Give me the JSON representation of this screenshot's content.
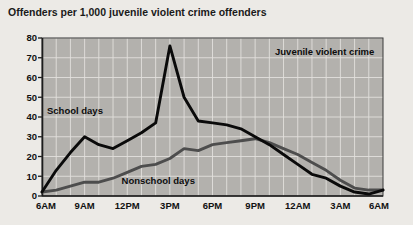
{
  "chart_data": {
    "type": "line",
    "title": "Offenders per 1,000 juvenile violent crime offenders",
    "xlabel": "",
    "ylabel": "",
    "ylim": [
      0,
      80
    ],
    "ytick_values": [
      0,
      10,
      20,
      30,
      40,
      50,
      60,
      70,
      80
    ],
    "ytick_labels": [
      "0",
      "10",
      "20",
      "30",
      "40",
      "50",
      "60",
      "70",
      "80"
    ],
    "xtick_labels": [
      "6AM",
      "9AM",
      "12PM",
      "3PM",
      "6PM",
      "9PM",
      "12AM",
      "3AM",
      "6AM"
    ],
    "xtick_positions": [
      0,
      3,
      6,
      9,
      12,
      15,
      18,
      21,
      24
    ],
    "x": [
      0,
      1,
      2,
      3,
      4,
      5,
      6,
      7,
      8,
      9,
      10,
      11,
      12,
      13,
      14,
      15,
      16,
      17,
      18,
      19,
      20,
      21,
      22,
      23,
      24
    ],
    "x_hour_labels": [
      "6AM",
      "7AM",
      "8AM",
      "9AM",
      "10AM",
      "11AM",
      "12PM",
      "1PM",
      "2PM",
      "3PM",
      "4PM",
      "5PM",
      "6PM",
      "7PM",
      "8PM",
      "9PM",
      "10PM",
      "11PM",
      "12AM",
      "1AM",
      "2AM",
      "3AM",
      "4AM",
      "5AM",
      "6AM"
    ],
    "grid": true,
    "legend_position": "inline-annotations",
    "annotations": [
      {
        "text": "Juvenile violent crime",
        "x_hour": 16.4,
        "y_value": 71.5
      },
      {
        "text": "School days",
        "x_hour": 0.35,
        "y_value": 41.5
      },
      {
        "text": "Nonschool days",
        "x_hour": 5.6,
        "y_value": 6.2
      }
    ],
    "series": [
      {
        "name": "School days",
        "color": "#0a0a0a",
        "values": [
          2,
          13,
          22,
          30,
          26,
          24,
          28,
          32,
          37,
          76,
          50,
          38,
          37,
          36,
          34,
          30,
          26,
          21,
          16,
          11,
          9,
          5,
          2,
          1,
          3
        ]
      },
      {
        "name": "Nonschool days",
        "color": "#4d4d4d",
        "values": [
          2,
          3,
          5,
          7,
          7,
          9,
          12,
          15,
          16,
          19,
          24,
          23,
          26,
          27,
          28,
          29,
          27,
          24,
          21,
          17,
          13,
          8,
          4,
          3,
          3
        ]
      }
    ]
  },
  "colors": {
    "page_background": "#eceae6",
    "plot_background": "#b3b1ad",
    "gridline": "#e2e0dc",
    "axis": "#1c1c1c",
    "school_days_line": "#0a0a0a",
    "nonschool_days_line": "#4d4d4d",
    "text": "#111111"
  }
}
